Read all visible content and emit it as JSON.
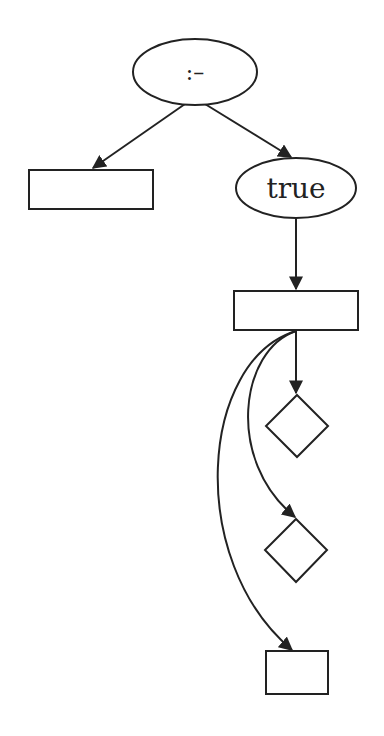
{
  "diagram": {
    "type": "tree-graph",
    "stroke_color": "#222222",
    "background": "#ffffff",
    "nodes": [
      {
        "id": "root",
        "shape": "ellipse",
        "label": ":–"
      },
      {
        "id": "left-box",
        "shape": "rectangle",
        "label": ""
      },
      {
        "id": "true-node",
        "shape": "ellipse",
        "label": "true"
      },
      {
        "id": "mid-box",
        "shape": "rectangle",
        "label": ""
      },
      {
        "id": "diamond-1",
        "shape": "diamond",
        "label": ""
      },
      {
        "id": "diamond-2",
        "shape": "diamond",
        "label": ""
      },
      {
        "id": "bottom-box",
        "shape": "rectangle",
        "label": ""
      }
    ],
    "edges": [
      {
        "from": "root",
        "to": "left-box",
        "style": "straight"
      },
      {
        "from": "root",
        "to": "true-node",
        "style": "straight"
      },
      {
        "from": "true-node",
        "to": "mid-box",
        "style": "straight"
      },
      {
        "from": "mid-box",
        "to": "diamond-1",
        "style": "straight"
      },
      {
        "from": "mid-box",
        "to": "diamond-2",
        "style": "curved"
      },
      {
        "from": "mid-box",
        "to": "bottom-box",
        "style": "curved"
      }
    ]
  }
}
